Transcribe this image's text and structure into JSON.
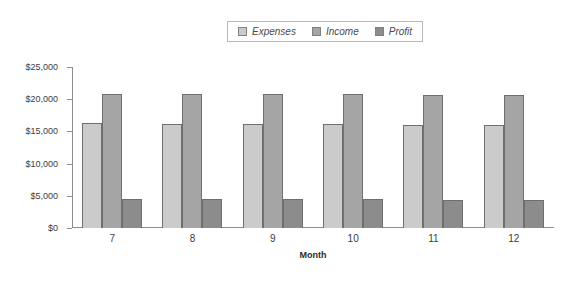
{
  "legend": {
    "position": "top-center",
    "entries": [
      {
        "label": "Expenses",
        "color": "#cbcbcb",
        "icon": "legend-swatch-icon"
      },
      {
        "label": "Income",
        "color": "#a5a5a5",
        "icon": "legend-swatch-icon"
      },
      {
        "label": "Profit",
        "color": "#8c8c8c",
        "icon": "legend-swatch-icon"
      }
    ]
  },
  "axes": {
    "y_ticks": [
      "$0",
      "$5,000",
      "$10,000",
      "$15,000",
      "$20,000",
      "$25,000"
    ],
    "x_title": "Month",
    "x_ticks": [
      "7",
      "8",
      "9",
      "10",
      "11",
      "12"
    ]
  },
  "chart_data": {
    "type": "bar",
    "title": "",
    "subtitle": "",
    "xlabel": "Month",
    "ylabel": "",
    "categories": [
      "7",
      "8",
      "9",
      "10",
      "11",
      "12"
    ],
    "series": [
      {
        "name": "Expenses",
        "color": "#cbcbcb",
        "values": [
          16300,
          16200,
          16150,
          16100,
          16050,
          16000
        ]
      },
      {
        "name": "Income",
        "color": "#a5a5a5",
        "values": [
          20800,
          20800,
          20750,
          20750,
          20700,
          20700
        ]
      },
      {
        "name": "Profit",
        "color": "#8c8c8c",
        "values": [
          4500,
          4500,
          4450,
          4450,
          4400,
          4400
        ]
      }
    ],
    "ylim": [
      0,
      25000
    ],
    "ytick_step": 5000,
    "ytick_values": [
      0,
      5000,
      10000,
      15000,
      20000,
      25000
    ],
    "grid": false,
    "legend_position": "top-center",
    "currency": "USD"
  }
}
